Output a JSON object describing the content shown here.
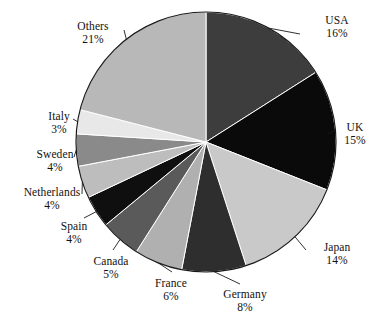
{
  "chart_data": {
    "type": "pie",
    "title": "",
    "subtitle": "",
    "xlabel": "",
    "ylabel": "",
    "legend_position": "none",
    "grid": false,
    "units": "percent",
    "start_angle_deg": 0,
    "direction": "clockwise",
    "categories": [
      "USA",
      "UK",
      "Japan",
      "Germany",
      "France",
      "Canada",
      "Spain",
      "Netherlands",
      "Sweden",
      "Italy",
      "Others"
    ],
    "values": [
      16,
      15,
      14,
      8,
      6,
      5,
      4,
      4,
      4,
      3,
      21
    ],
    "slices": [
      {
        "label": "USA",
        "value": 16,
        "pct_text": "16%",
        "color": "#3d3d3d"
      },
      {
        "label": "UK",
        "value": 15,
        "pct_text": "15%",
        "color": "#0a0a0a"
      },
      {
        "label": "Japan",
        "value": 14,
        "pct_text": "14%",
        "color": "#c9c9c9"
      },
      {
        "label": "Germany",
        "value": 8,
        "pct_text": "8%",
        "color": "#2e2e2e"
      },
      {
        "label": "France",
        "value": 6,
        "pct_text": "6%",
        "color": "#b0b0b0"
      },
      {
        "label": "Canada",
        "value": 5,
        "pct_text": "5%",
        "color": "#5a5a5a"
      },
      {
        "label": "Spain",
        "value": 4,
        "pct_text": "4%",
        "color": "#0f0f0f"
      },
      {
        "label": "Netherlands",
        "value": 4,
        "pct_text": "4%",
        "color": "#bdbdbd"
      },
      {
        "label": "Sweden",
        "value": 4,
        "pct_text": "4%",
        "color": "#8a8a8a"
      },
      {
        "label": "Italy",
        "value": 3,
        "pct_text": "3%",
        "color": "#e8e8e8"
      },
      {
        "label": "Others",
        "value": 21,
        "pct_text": "21%",
        "color": "#b8b8b8"
      }
    ],
    "geometry": {
      "cx": 206,
      "cy": 142,
      "r": 130
    },
    "colors": {
      "outline": "#1a1a1a",
      "leader_line": "#1a1a1a",
      "background": "#ffffff",
      "text": "#111111"
    }
  },
  "labels": {
    "usa": {
      "name": "USA",
      "pct": "16%"
    },
    "uk": {
      "name": "UK",
      "pct": "15%"
    },
    "japan": {
      "name": "Japan",
      "pct": "14%"
    },
    "germany": {
      "name": "Germany",
      "pct": "8%"
    },
    "france": {
      "name": "France",
      "pct": "6%"
    },
    "canada": {
      "name": "Canada",
      "pct": "5%"
    },
    "spain": {
      "name": "Spain",
      "pct": "4%"
    },
    "netherlands": {
      "name": "Netherlands",
      "pct": "4%"
    },
    "sweden": {
      "name": "Sweden",
      "pct": "4%"
    },
    "italy": {
      "name": "Italy",
      "pct": "3%"
    },
    "others": {
      "name": "Others",
      "pct": "21%"
    }
  }
}
